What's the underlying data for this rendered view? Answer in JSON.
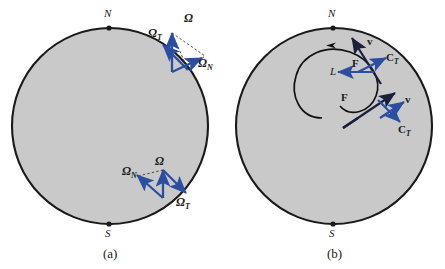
{
  "figure": {
    "caption_a": "(a)",
    "caption_b": "(b)",
    "colors": {
      "sphere_fill": "#c9c9c9",
      "sphere_stroke": "#1a1a1a",
      "vector_blue": "#2b4ea2",
      "vector_dark": "#1a1f3d",
      "dashed": "#3a3a3a",
      "text": "#1a1a1a",
      "background": "#ffffff"
    }
  },
  "panel_a": {
    "label": "(a)",
    "north_pole": "N",
    "south_pole": "S",
    "groups": [
      {
        "name": "northern-latitude-decomposition",
        "total": "Ω",
        "tangential": "Ω",
        "tangential_sub": "T",
        "normal": "Ω",
        "normal_sub": "N"
      },
      {
        "name": "southern-latitude-decomposition",
        "total": "Ω",
        "normal": "Ω",
        "normal_sub": "N",
        "tangential": "Ω",
        "tangential_sub": "T"
      }
    ]
  },
  "panel_b": {
    "label": "(b)",
    "north_pole": "N",
    "south_pole": "S",
    "trajectory_label": "L",
    "groups": [
      {
        "name": "upper-vector-set",
        "velocity": "v",
        "force": "F",
        "coriolis": "C",
        "coriolis_sub": "T"
      },
      {
        "name": "lower-vector-set",
        "force": "F",
        "velocity": "v",
        "coriolis": "C",
        "coriolis_sub": "T"
      }
    ]
  }
}
